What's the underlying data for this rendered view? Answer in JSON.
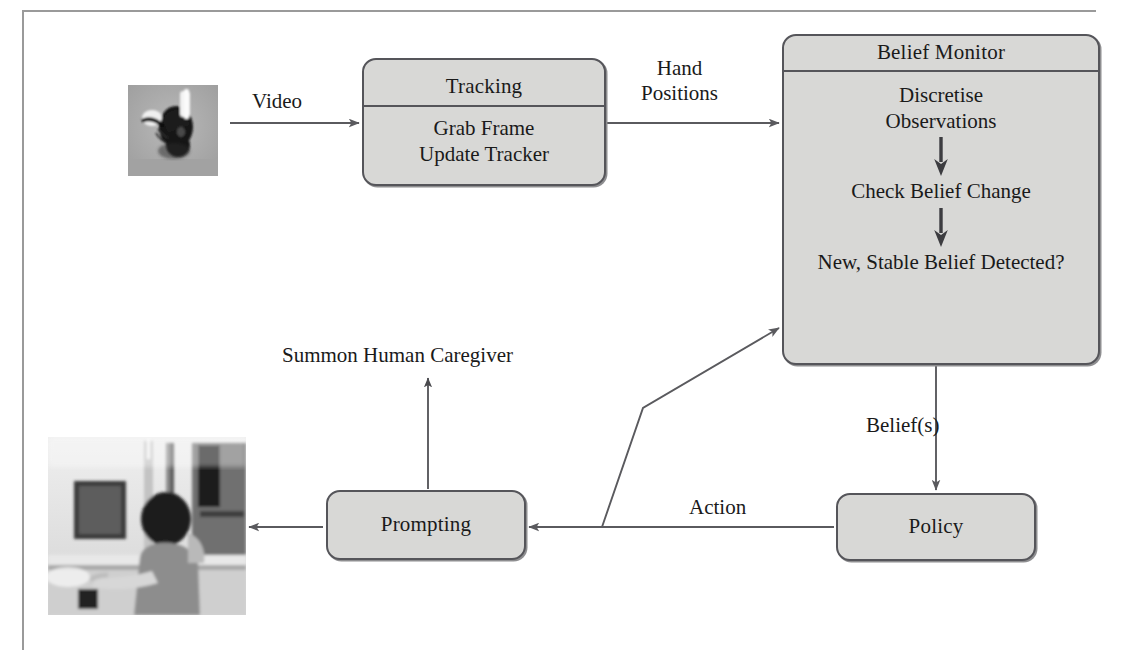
{
  "diagram": {
    "nodes": {
      "tracking": {
        "title": "Tracking",
        "line1": "Grab Frame",
        "line2": "Update Tracker"
      },
      "belief_monitor": {
        "title": "Belief Monitor",
        "steps": [
          "Discretise",
          "Observations",
          "Check Belief Change",
          "New, Stable Belief Detected?"
        ],
        "step1_line1": "Discretise",
        "step1_line2": "Observations",
        "step2": "Check Belief Change",
        "step3": "New, Stable Belief Detected?"
      },
      "prompting": {
        "title": "Prompting"
      },
      "policy": {
        "title": "Policy"
      }
    },
    "edge_labels": {
      "video": "Video",
      "hand_line1": "Hand",
      "hand_line2": "Positions",
      "beliefs": "Belief(s)",
      "action": "Action",
      "summon": "Summon Human Caregiver"
    },
    "images": {
      "hand_thumbnail": "hand-tracking-thumbnail",
      "scene_thumbnail": "kitchen-scene-thumbnail"
    },
    "colors": {
      "node_fill": "#d8d8d6",
      "node_border": "#55555a",
      "edge_stroke": "#5a5a5e",
      "text": "#1a1a1a",
      "rule": "#9a9a9a"
    }
  }
}
